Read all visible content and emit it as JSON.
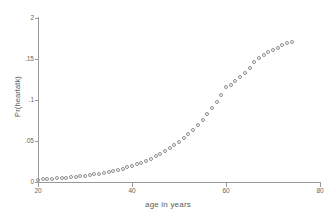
{
  "chart_data": {
    "type": "scatter",
    "title": "",
    "subtitle": "",
    "xlabel": "age in years",
    "ylabel": "Pr(heartatk)",
    "xlim": [
      20,
      80
    ],
    "ylim": [
      0,
      0.2
    ],
    "grid": false,
    "legend": null,
    "marker": {
      "style": "open-circle",
      "color": "#8e8e8e",
      "size_px": 4,
      "filled": false
    },
    "xticks": [
      20,
      40,
      60,
      80
    ],
    "xtick_labels": [
      "20",
      "40",
      "60",
      "80"
    ],
    "yticks": [
      0,
      0.05,
      0.1,
      0.15,
      0.2
    ],
    "ytick_labels": [
      "0",
      ".05",
      ".1",
      ".15",
      "2"
    ],
    "series": [
      {
        "name": "Pr(heartatk)",
        "x": [
          20,
          21,
          22,
          23,
          24,
          25,
          26,
          27,
          28,
          29,
          30,
          31,
          32,
          33,
          34,
          35,
          36,
          37,
          38,
          39,
          40,
          41,
          42,
          43,
          44,
          45,
          46,
          47,
          48,
          49,
          50,
          51,
          52,
          53,
          54,
          55,
          56,
          57,
          58,
          59,
          60,
          61,
          62,
          63,
          64,
          65,
          66,
          67,
          68,
          69,
          70,
          71,
          72,
          73,
          74
        ],
        "y": [
          0.003,
          0.0033,
          0.0036,
          0.004,
          0.0044,
          0.0048,
          0.0053,
          0.0058,
          0.0064,
          0.007,
          0.0077,
          0.0085,
          0.0093,
          0.0102,
          0.0112,
          0.0123,
          0.0135,
          0.0148,
          0.0163,
          0.0179,
          0.0196,
          0.0215,
          0.0236,
          0.0259,
          0.0284,
          0.0311,
          0.0341,
          0.0373,
          0.0409,
          0.0447,
          0.0489,
          0.0535,
          0.0584,
          0.0638,
          0.0696,
          0.0759,
          0.0827,
          0.0901,
          0.098,
          0.1065,
          0.1156,
          0.1187,
          0.1232,
          0.1276,
          0.133,
          0.1392,
          0.146,
          0.1508,
          0.1545,
          0.1581,
          0.1612,
          0.164,
          0.1668,
          0.1692,
          0.171
        ]
      }
    ]
  },
  "axes": {
    "xlabel": "age in years",
    "ylabel": "Pr(heartatk)"
  }
}
